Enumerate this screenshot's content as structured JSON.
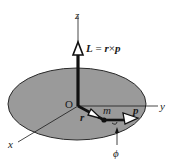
{
  "diagram": {
    "type": "angular-momentum-vector",
    "colors": {
      "disk_fill": "#9a9a9a",
      "disk_stroke": "#2a2a2a",
      "line": "#1a1a1a",
      "background": "#ffffff"
    },
    "labels": {
      "z_axis": "z",
      "y_axis": "y",
      "x_axis": "x",
      "origin": "O",
      "L_vector": "L",
      "equals": " = ",
      "r_term": "r",
      "cross": "×",
      "p_term": "p",
      "r_vector": "r",
      "mass": "m",
      "p_vector": "p",
      "angle": "ϕ"
    }
  }
}
